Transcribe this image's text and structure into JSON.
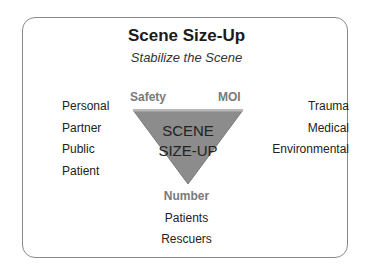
{
  "title": "Scene Size-Up",
  "subtitle": "Stabilize the Scene",
  "triangle": {
    "line1": "SCENE",
    "line2": "SIZE-UP",
    "fill": "#8c8c8c",
    "top_edge": "#b5b5b5"
  },
  "corners": {
    "top_left": "Safety",
    "top_right": "MOI",
    "bottom": "Number"
  },
  "left_list": [
    "Personal",
    "Partner",
    "Public",
    "Patient"
  ],
  "right_list": [
    "Trauma",
    "Medical",
    "Environmental"
  ],
  "bottom_list": [
    "Patients",
    "Rescuers"
  ]
}
